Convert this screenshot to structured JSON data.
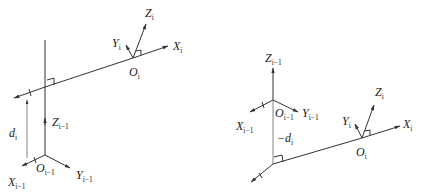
{
  "diagram": {
    "left": {
      "labels": {
        "z_i": "Z",
        "z_i_sub": "i",
        "y_i": "Y",
        "y_i_sub": "i",
        "x_i": "X",
        "x_i_sub": "i",
        "o_i": "O",
        "o_i_sub": "i",
        "z_prev": "Z",
        "z_prev_sub": "i−1",
        "d": "d",
        "d_sub": "i",
        "x_prev": "X",
        "x_prev_sub": "i−1",
        "o_prev": "O",
        "o_prev_sub": "i−1",
        "y_prev": "Y",
        "y_prev_sub": "i−1"
      }
    },
    "right": {
      "labels": {
        "z_prev": "Z",
        "z_prev_sub": "i−1",
        "x_prev": "X",
        "x_prev_sub": "i−1",
        "o_prev": "O",
        "o_prev_sub": "i−1",
        "y_prev": "Y",
        "y_prev_sub": "i−1",
        "d": "−d",
        "d_sub": "i",
        "z_i": "Z",
        "z_i_sub": "i",
        "y_i": "Y",
        "y_i_sub": "i",
        "x_i": "X",
        "x_i_sub": "i",
        "o_i": "O",
        "o_i_sub": "i"
      }
    }
  }
}
